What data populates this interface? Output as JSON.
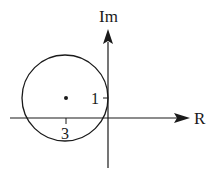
{
  "diagram": {
    "type": "complex-plane",
    "axes": {
      "horizontal_label": "R",
      "vertical_label": "Im"
    },
    "ticks": {
      "real_tick_label": "3",
      "imag_tick_label": "1"
    },
    "circle": {
      "center_marker": "dot",
      "tangent_to": "imaginary axis"
    },
    "colors": {
      "stroke": "#1a1a1a",
      "background": "#ffffff"
    }
  }
}
